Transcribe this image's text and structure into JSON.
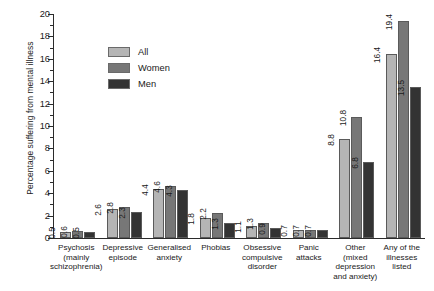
{
  "chart_data": {
    "type": "bar",
    "title": "",
    "xlabel": "",
    "ylabel": "Percentage suffering from mental illness",
    "ylim": [
      0,
      20
    ],
    "ytick_step": 2,
    "minor_ticks": true,
    "grid": false,
    "legend_position": "upper-left-inside",
    "categories": [
      "Psychosis (mainly schizophrenia)",
      "Depressive episode",
      "Generalised anxiety",
      "Phobias",
      "Obsessive compulsive disorder",
      "Panic attacks",
      "Other (mixed depression and anxiety)",
      "Any of the illnesses listed"
    ],
    "category_lines": [
      [
        "Psychosis",
        "(mainly",
        "schizophrenia)"
      ],
      [
        "Depressive",
        "episode"
      ],
      [
        "Generalised",
        "anxiety"
      ],
      [
        "Phobias"
      ],
      [
        "Obsessive",
        "compulsive",
        "disorder"
      ],
      [
        "Panic",
        "attacks"
      ],
      [
        "Other",
        "(mixed",
        "depression",
        "and anxiety)"
      ],
      [
        "Any of the",
        "illnesses",
        "listed"
      ]
    ],
    "ytick_labels": [
      "0",
      "2",
      "4",
      "6",
      "8",
      "10",
      "12",
      "14",
      "16",
      "18",
      "20"
    ],
    "series": [
      {
        "name": "All",
        "color": "#b5b5b5",
        "values": [
          0.5,
          2.6,
          4.4,
          1.8,
          1.1,
          0.7,
          8.8,
          16.4
        ],
        "labels": [
          "0.5",
          "2.6",
          "4.4",
          "1.8",
          "1.1",
          "0.7",
          "8.8",
          "16.4"
        ]
      },
      {
        "name": "Women",
        "color": "#777777",
        "values": [
          0.6,
          2.8,
          4.6,
          2.2,
          1.3,
          0.7,
          10.8,
          19.4
        ],
        "labels": [
          "0.6",
          "2.8",
          "4.6",
          "2.2",
          "1.3",
          "0.7",
          "10.8",
          "19.4"
        ]
      },
      {
        "name": "Men",
        "color": "#333333",
        "values": [
          0.5,
          2.3,
          4.3,
          1.3,
          0.9,
          0.7,
          6.8,
          13.5
        ],
        "labels": [
          "0.5",
          "2.3",
          "4.3",
          "1.3",
          "0.9",
          "0.7",
          "6.8",
          "13.5"
        ]
      }
    ]
  },
  "legend": {
    "items": [
      {
        "label": "All",
        "key": "all"
      },
      {
        "label": "Women",
        "key": "women"
      },
      {
        "label": "Men",
        "key": "men"
      }
    ]
  }
}
